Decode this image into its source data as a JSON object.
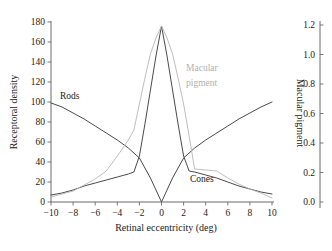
{
  "chart_data": {
    "type": "line",
    "title": "",
    "xlabel": "Retinal eccentricity (deg)",
    "ylabel": "Receptoral density",
    "y2label": "Macular pigment",
    "xlim": [
      -10,
      10
    ],
    "ylim": [
      0,
      180
    ],
    "y2lim": [
      0.0,
      1.2
    ],
    "grid": false,
    "legend": "inline-annotations",
    "xticks": [
      "−10",
      "−8",
      "−6",
      "−4",
      "−2",
      "0",
      "2",
      "4",
      "6",
      "8",
      "10"
    ],
    "xtick_values": [
      -10,
      -8,
      -6,
      -4,
      -2,
      0,
      2,
      4,
      6,
      8,
      10
    ],
    "yticks": [
      "0",
      "20",
      "40",
      "60",
      "80",
      "100",
      "120",
      "140",
      "160",
      "180"
    ],
    "ytick_values": [
      0,
      20,
      40,
      60,
      80,
      100,
      120,
      140,
      160,
      180
    ],
    "y2ticks": [
      "0.0",
      "0.2",
      "0.4",
      "0.6",
      "0.8",
      "1.0",
      "1.2"
    ],
    "y2tick_values": [
      0.0,
      0.2,
      0.4,
      0.6,
      0.8,
      1.0,
      1.2
    ],
    "series": [
      {
        "name": "Rods",
        "axis": "left",
        "color": "#4a4a4a",
        "label_text": "Rods",
        "x": [
          -10,
          -9,
          -8,
          -7,
          -6,
          -5,
          -4,
          -3,
          -2,
          -1,
          -0.5,
          0,
          0.5,
          1,
          2,
          3,
          4,
          5,
          6,
          7,
          8,
          9,
          10
        ],
        "values": [
          99,
          95,
          89,
          83,
          76,
          69,
          62,
          54,
          44,
          24,
          12,
          0,
          12,
          24,
          44,
          54,
          62,
          69,
          76,
          83,
          89,
          95,
          100
        ]
      },
      {
        "name": "Cones",
        "axis": "left",
        "color": "#4a4a4a",
        "label_text": "Cones",
        "x": [
          -10,
          -9,
          -8,
          -7,
          -6,
          -5,
          -4,
          -3,
          -2.5,
          -2,
          -1.5,
          -1,
          -0.5,
          0,
          0.5,
          1,
          1.5,
          2,
          2.5,
          3,
          4,
          5,
          6,
          7,
          8,
          9,
          10
        ],
        "values": [
          7,
          9,
          12,
          16,
          19,
          22,
          25,
          28,
          30,
          46,
          78,
          112,
          146,
          176,
          146,
          112,
          78,
          46,
          31,
          30,
          27,
          24,
          20,
          16,
          13,
          10,
          8
        ]
      },
      {
        "name": "Macular pigment",
        "axis": "right",
        "color": "#b5b5b5",
        "label_text": "Macular pigment",
        "x": [
          -10,
          -9,
          -8,
          -7,
          -6,
          -5,
          -4,
          -3,
          -2.5,
          -2,
          -1.5,
          -1,
          -0.5,
          0,
          0.5,
          1,
          1.5,
          2,
          2.5,
          3,
          4,
          5,
          6,
          7,
          8,
          9,
          10
        ],
        "values_left_scale": [
          5,
          8,
          11,
          17,
          23,
          31,
          46,
          62,
          72,
          98,
          124,
          148,
          164,
          176,
          164,
          148,
          124,
          98,
          66,
          33,
          32,
          31,
          24,
          18,
          13,
          9,
          4
        ],
        "values": [
          0.033,
          0.053,
          0.073,
          0.113,
          0.153,
          0.207,
          0.307,
          0.413,
          0.48,
          0.653,
          0.827,
          0.987,
          1.093,
          1.173,
          1.093,
          0.987,
          0.827,
          0.653,
          0.44,
          0.22,
          0.213,
          0.207,
          0.16,
          0.12,
          0.087,
          0.06,
          0.027
        ]
      }
    ],
    "annotations": [
      {
        "name": "rods-label",
        "text": "Rods",
        "x_px": 60,
        "y_px": 99,
        "color": "#1a1a1a"
      },
      {
        "name": "cones-label",
        "text": "Cones",
        "x_px": 190,
        "y_px": 182,
        "color": "#1a1a1a"
      },
      {
        "name": "macular-pigment-label-line1",
        "text": "Macular",
        "x_px": 186,
        "y_px": 71,
        "color": "#b0b0b0"
      },
      {
        "name": "macular-pigment-label-line2",
        "text": "pigment",
        "x_px": 186,
        "y_px": 86,
        "color": "#b0b0b0"
      }
    ],
    "colors": {
      "rods": "#4a4a4a",
      "cones": "#4a4a4a",
      "macular_pigment": "#b5b5b5",
      "macular_pigment_label": "#b0b0b0",
      "axis": "#5a5a5a",
      "text": "#1a1a1a",
      "background": "#ffffff"
    }
  }
}
